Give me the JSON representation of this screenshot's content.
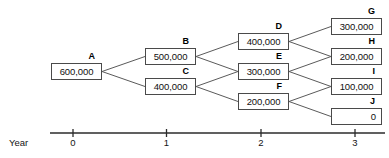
{
  "diagram": {
    "type": "decision-tree",
    "title": "",
    "nodes": [
      {
        "id": "A",
        "label": "A",
        "value": "600,000",
        "x": 51,
        "y": 63,
        "year": 0,
        "align": "center"
      },
      {
        "id": "B",
        "label": "B",
        "value": "500,000",
        "x": 145,
        "y": 48,
        "year": 1,
        "align": "center"
      },
      {
        "id": "C",
        "label": "C",
        "value": "400,000",
        "x": 145,
        "y": 78,
        "year": 1,
        "align": "center"
      },
      {
        "id": "D",
        "label": "D",
        "value": "400,000",
        "x": 238,
        "y": 33,
        "year": 2,
        "align": "center"
      },
      {
        "id": "E",
        "label": "E",
        "value": "300,000",
        "x": 238,
        "y": 63,
        "year": 2,
        "align": "center"
      },
      {
        "id": "F",
        "label": "F",
        "value": "200,000",
        "x": 238,
        "y": 93,
        "year": 2,
        "align": "center"
      },
      {
        "id": "G",
        "label": "G",
        "value": "300,000",
        "x": 331,
        "y": 18,
        "year": 3,
        "align": "center"
      },
      {
        "id": "H",
        "label": "H",
        "value": "200,000",
        "x": 331,
        "y": 48,
        "year": 3,
        "align": "center"
      },
      {
        "id": "I",
        "label": "I",
        "value": "100,000",
        "x": 331,
        "y": 78,
        "year": 3,
        "align": "center"
      },
      {
        "id": "J",
        "label": "J",
        "value": "0",
        "x": 331,
        "y": 108,
        "year": 3,
        "align": "right"
      }
    ],
    "edges": [
      {
        "from": "A",
        "to": "B"
      },
      {
        "from": "A",
        "to": "C"
      },
      {
        "from": "B",
        "to": "D"
      },
      {
        "from": "B",
        "to": "E"
      },
      {
        "from": "C",
        "to": "E"
      },
      {
        "from": "C",
        "to": "F"
      },
      {
        "from": "D",
        "to": "G"
      },
      {
        "from": "D",
        "to": "H"
      },
      {
        "from": "E",
        "to": "H"
      },
      {
        "from": "E",
        "to": "I"
      },
      {
        "from": "F",
        "to": "I"
      },
      {
        "from": "F",
        "to": "J"
      }
    ],
    "colors": {
      "box_border": "#4a4a4a",
      "edge_line": "#5a5a5a",
      "axis_line": "#2b2b2b",
      "text": "#111111",
      "background": "#ffffff"
    }
  },
  "axis": {
    "caption": "Year",
    "line": {
      "x1": 50,
      "x2": 385,
      "y": 133
    },
    "ticks": [
      {
        "label": "0",
        "x": 73
      },
      {
        "label": "1",
        "x": 166.5
      },
      {
        "label": "2",
        "x": 261
      },
      {
        "label": "3",
        "x": 355
      }
    ],
    "tick_label_y": 138
  }
}
